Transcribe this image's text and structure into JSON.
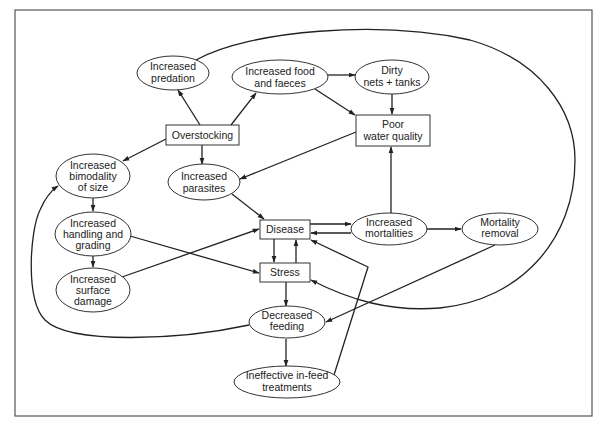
{
  "diagram": {
    "type": "flowchart",
    "nodes": {
      "overstocking": {
        "shape": "rect",
        "lines": [
          "Overstocking"
        ]
      },
      "increased_predation": {
        "shape": "ellipse",
        "lines": [
          "Increased",
          "predation"
        ]
      },
      "increased_food_faeces": {
        "shape": "ellipse",
        "lines": [
          "Increased food",
          "and faeces"
        ]
      },
      "dirty_nets_tanks": {
        "shape": "ellipse",
        "lines": [
          "Dirty",
          "nets + tanks"
        ]
      },
      "poor_water_quality": {
        "shape": "rect",
        "lines": [
          "Poor",
          "water quality"
        ]
      },
      "increased_bimodality": {
        "shape": "ellipse",
        "lines": [
          "Increased",
          "bimodality",
          "of size"
        ]
      },
      "increased_parasites": {
        "shape": "ellipse",
        "lines": [
          "Increased",
          "parasites"
        ]
      },
      "increased_handling": {
        "shape": "ellipse",
        "lines": [
          "Increased",
          "handling and",
          "grading"
        ]
      },
      "increased_surface_damage": {
        "shape": "ellipse",
        "lines": [
          "Increased",
          "surface",
          "damage"
        ]
      },
      "disease": {
        "shape": "rect",
        "lines": [
          "Disease"
        ]
      },
      "stress": {
        "shape": "rect",
        "lines": [
          "Stress"
        ]
      },
      "increased_mortalities": {
        "shape": "ellipse",
        "lines": [
          "Increased",
          "mortalities"
        ]
      },
      "mortality_removal": {
        "shape": "ellipse",
        "lines": [
          "Mortality",
          "removal"
        ]
      },
      "decreased_feeding": {
        "shape": "ellipse",
        "lines": [
          "Decreased",
          "feeding"
        ]
      },
      "ineffective_treatments": {
        "shape": "ellipse",
        "lines": [
          "Ineffective in-feed",
          "treatments"
        ]
      }
    },
    "edges": [
      {
        "from": "Overstocking",
        "to": "Increased predation"
      },
      {
        "from": "Overstocking",
        "to": "Increased food and faeces"
      },
      {
        "from": "Overstocking",
        "to": "Increased bimodality of size"
      },
      {
        "from": "Overstocking",
        "to": "Increased parasites"
      },
      {
        "from": "Increased food and faeces",
        "to": "Dirty nets + tanks"
      },
      {
        "from": "Increased food and faeces",
        "to": "Poor water quality"
      },
      {
        "from": "Dirty nets + tanks",
        "to": "Poor water quality"
      },
      {
        "from": "Poor water quality",
        "to": "Increased parasites"
      },
      {
        "from": "Increased parasites",
        "to": "Disease"
      },
      {
        "from": "Increased bimodality of size",
        "to": "Increased handling and grading"
      },
      {
        "from": "Increased handling and grading",
        "to": "Increased surface damage"
      },
      {
        "from": "Increased handling and grading",
        "to": "Stress"
      },
      {
        "from": "Increased surface damage",
        "to": "Disease"
      },
      {
        "from": "Disease",
        "to": "Stress"
      },
      {
        "from": "Stress",
        "to": "Disease"
      },
      {
        "from": "Disease",
        "to": "Increased mortalities"
      },
      {
        "from": "Increased mortalities",
        "to": "Disease"
      },
      {
        "from": "Increased mortalities",
        "to": "Poor water quality"
      },
      {
        "from": "Increased mortalities",
        "to": "Mortality removal"
      },
      {
        "from": "Mortality removal",
        "to": "Decreased feeding"
      },
      {
        "from": "Stress",
        "to": "Decreased feeding"
      },
      {
        "from": "Decreased feeding",
        "to": "Ineffective in-feed treatments"
      },
      {
        "from": "Ineffective in-feed treatments",
        "to": "Disease"
      },
      {
        "from": "Increased predation",
        "to": "Stress",
        "note": "large loop around right side"
      },
      {
        "from": "Decreased feeding",
        "to": "Increased bimodality of size",
        "note": "large loop around left side"
      }
    ]
  }
}
